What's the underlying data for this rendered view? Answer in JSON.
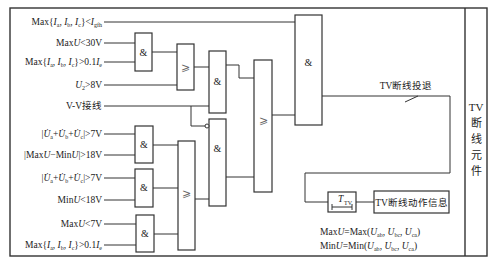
{
  "inputs": [
    {
      "id": "in1",
      "label": "Max{Ia, Ib, Ic}<Igfh"
    },
    {
      "id": "in2",
      "label": "MaxU<30V"
    },
    {
      "id": "in3",
      "label": "Max{Ia, Ib, Ic}>0.1Ie"
    },
    {
      "id": "in4",
      "label": "U2>8V"
    },
    {
      "id": "in5",
      "label": "V-V接线"
    },
    {
      "id": "in6",
      "label": "|U̇a+U̇b+U̇c|>7V"
    },
    {
      "id": "in7",
      "label": "|MaxU−MinU|>18V"
    },
    {
      "id": "in8",
      "label": "|U̇a+U̇b+U̇c|>7V"
    },
    {
      "id": "in9",
      "label": "MinU<18V"
    },
    {
      "id": "in10",
      "label": "MaxU<7V"
    },
    {
      "id": "in11",
      "label": "Max{Ia, Ib, Ic}>0.1Ie"
    }
  ],
  "gates": {
    "and_symbol": "&",
    "or_symbol": "⩾"
  },
  "labels": {
    "tv_exit": "TV断线投退",
    "timer": "T",
    "timer_sub": "TV",
    "action_info": "TV断线动作信息",
    "side_title": [
      "TV",
      "断",
      "线",
      "元",
      "件"
    ],
    "note1": "MaxU=Max(Uab, Ubc, Uca)",
    "note2": "MinU=Min(Uab, Ubc, Uca)"
  }
}
